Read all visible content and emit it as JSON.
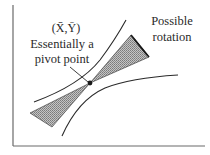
{
  "diagram": {
    "mean_point_label": "(X̄,Ȳ)",
    "pivot_label_line1": "Essentially a",
    "pivot_label_line2": "pivot point",
    "rotation_label_line1": "Possible",
    "rotation_label_line2": "rotation",
    "colors": {
      "line": "#2a2a2a",
      "axis": "#6a6a6a",
      "hatch_fill": "#a8a8a8"
    }
  }
}
